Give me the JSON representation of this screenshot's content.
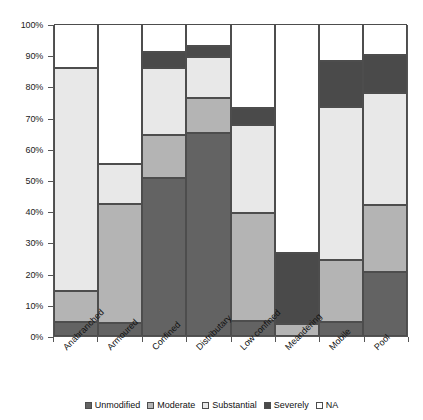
{
  "chart_data": {
    "type": "bar",
    "subtype": "stacked-100-percent",
    "title": "",
    "xlabel": "",
    "ylabel": "",
    "ylim": [
      0,
      100
    ],
    "grid": false,
    "legend_position": "bottom",
    "y_tick_labels": [
      "0%",
      "10%",
      "20%",
      "30%",
      "40%",
      "50%",
      "60%",
      "70%",
      "80%",
      "90%",
      "100%"
    ],
    "y_tick_values": [
      0,
      10,
      20,
      30,
      40,
      50,
      60,
      70,
      80,
      90,
      100
    ],
    "categories": [
      "Anabranched",
      "Armoured",
      "Confined",
      "Distributary",
      "Low confined",
      "Meandering",
      "Mobile",
      "Pool"
    ],
    "series": [
      {
        "name": "Unmodified",
        "color": "#636363",
        "values": [
          4.5,
          4.3,
          50.5,
          65.0,
          4.8,
          0.0,
          4.5,
          20.5
        ]
      },
      {
        "name": "Moderate",
        "color": "#b4b4b4",
        "values": [
          9.9,
          37.9,
          13.8,
          11.3,
          34.7,
          4.0,
          20.0,
          21.5
        ]
      },
      {
        "name": "Substantial",
        "color": "#e8e8e8",
        "values": [
          71.6,
          12.8,
          21.7,
          13.2,
          28.0,
          0.0,
          49.0,
          36.0
        ]
      },
      {
        "name": "Severely",
        "color": "#4a4a4a",
        "values": [
          0.0,
          0.0,
          5.0,
          3.5,
          5.5,
          22.5,
          14.5,
          12.0
        ]
      },
      {
        "name": "NA",
        "color": "#ffffff",
        "values": [
          14.0,
          45.0,
          9.0,
          7.0,
          27.0,
          73.5,
          12.0,
          10.0
        ]
      }
    ],
    "cumulative_tops": {
      "Anabranched": [
        4.5,
        14.4,
        86.0,
        86.0,
        100.0
      ],
      "Armoured": [
        4.3,
        42.2,
        55.0,
        55.0,
        100.0
      ],
      "Confined": [
        50.5,
        64.3,
        86.0,
        91.0,
        100.0
      ],
      "Distributary": [
        65.0,
        76.3,
        89.5,
        93.0,
        100.0
      ],
      "Low confined": [
        4.8,
        39.5,
        67.5,
        73.0,
        100.0
      ],
      "Meandering": [
        0.0,
        4.0,
        4.0,
        26.5,
        100.0
      ],
      "Mobile": [
        4.5,
        24.5,
        73.5,
        88.0,
        100.0
      ],
      "Pool": [
        20.5,
        42.0,
        78.0,
        90.0,
        100.0
      ]
    }
  },
  "legend": {
    "items": [
      {
        "label": "Unmodified",
        "color": "#636363"
      },
      {
        "label": "Moderate",
        "color": "#b4b4b4"
      },
      {
        "label": "Substantial",
        "color": "#e8e8e8"
      },
      {
        "label": "Severely",
        "color": "#4a4a4a"
      },
      {
        "label": "NA",
        "color": "#ffffff"
      }
    ]
  }
}
